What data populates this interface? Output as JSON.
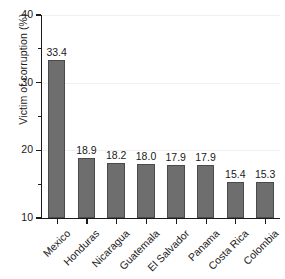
{
  "chart_data": {
    "type": "bar",
    "title": "",
    "subtitle": "",
    "xlabel": "",
    "ylabel": "Victim of corruption (%)",
    "categories": [
      "Mexico",
      "Honduras",
      "Nicaragua",
      "Guatemala",
      "El Salvador",
      "Panama",
      "Costa Rica",
      "Colombia"
    ],
    "values": [
      33.4,
      18.9,
      18.2,
      18.0,
      17.9,
      17.9,
      15.4,
      15.3
    ],
    "value_labels": [
      "33.4",
      "18.9",
      "18.2",
      "18.0",
      "17.9",
      "17.9",
      "15.4",
      "15.3"
    ],
    "ylim": [
      10,
      40
    ],
    "ytick_labels": [
      "40",
      "30",
      "20",
      "10"
    ],
    "ytick_values": [
      40,
      30,
      20,
      10
    ],
    "yminor_tick_values": [
      35,
      25,
      15
    ],
    "grid": "horizontal-faint",
    "legend": "none",
    "bar_color": "#6e6e6e",
    "bar_edge_color": "#4a4a4a",
    "axis_color": "#1a1a1a",
    "grid_color": "#f0f0f0",
    "background_color": "#ffffff"
  }
}
